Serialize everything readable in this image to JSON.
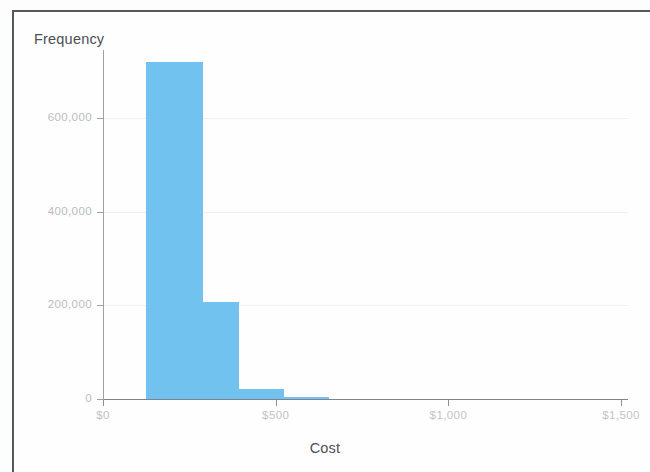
{
  "chart_data": {
    "type": "bar",
    "chart_subtype": "histogram",
    "title": "",
    "xlabel": "Cost",
    "ylabel": "Frequency",
    "xlim": [
      0,
      1520
    ],
    "ylim": [
      0,
      745000
    ],
    "grid": true,
    "legend": null,
    "bar_color": "#72c2f0",
    "x_tick_labels": [
      "$0",
      "$500",
      "$1,000",
      "$1,500"
    ],
    "x_tick_values": [
      0,
      500,
      1000,
      1500
    ],
    "y_tick_labels": [
      "0",
      "200,000",
      "400,000",
      "600,000"
    ],
    "y_tick_values": [
      0,
      200000,
      400000,
      600000
    ],
    "bin_width": 130,
    "bins": [
      {
        "x_start": 125,
        "x_end": 290,
        "value": 720000
      },
      {
        "x_start": 290,
        "x_end": 395,
        "value": 208000
      },
      {
        "x_start": 395,
        "x_end": 525,
        "value": 21000
      },
      {
        "x_start": 525,
        "x_end": 655,
        "value": 5000
      }
    ],
    "categories": [
      "125-290",
      "290-395",
      "395-525",
      "525-655"
    ],
    "values": [
      720000,
      208000,
      21000,
      5000
    ]
  },
  "axis": {
    "y_title": "Frequency",
    "x_title": "Cost"
  }
}
